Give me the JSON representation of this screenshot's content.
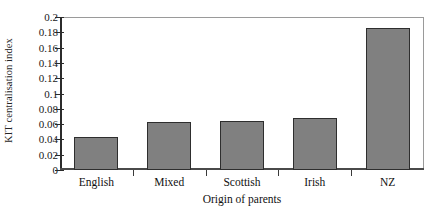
{
  "chart_data": {
    "type": "bar",
    "title": "",
    "xlabel": "Origin of parents",
    "ylabel": "KIT centralisation index",
    "categories": [
      "English",
      "Mixed",
      "Scottish",
      "Irish",
      "NZ"
    ],
    "values": [
      0.043,
      0.063,
      0.064,
      0.068,
      0.185
    ],
    "ylim": [
      0,
      0.2
    ],
    "ytick_labels": [
      "0",
      "0.02",
      "0.04",
      "0.06",
      "0.08",
      "0.1",
      "0.12",
      "0.14",
      "0.16",
      "0.18",
      "0.2"
    ],
    "ytick_values": [
      0,
      0.02,
      0.04,
      0.06,
      0.08,
      0.1,
      0.12,
      0.14,
      0.16,
      0.18,
      0.2
    ],
    "grid": false,
    "legend": "none",
    "bar_color": "#808080",
    "bar_edge_color": "#2e2e2e",
    "axis_color": "#2b2b2b",
    "background": "#ffffff"
  }
}
